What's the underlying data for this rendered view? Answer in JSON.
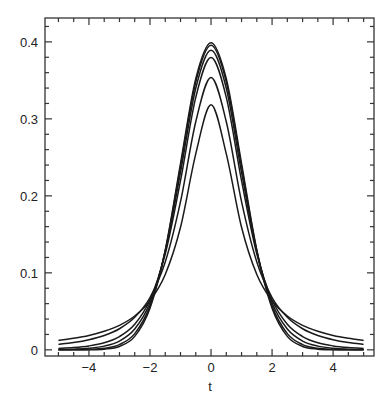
{
  "chart_data": {
    "type": "line",
    "title": "",
    "xlabel": "t",
    "ylabel": "",
    "xlim": [
      -5.44,
      5.34
    ],
    "ylim": [
      -0.008,
      0.431
    ],
    "grid": false,
    "legend": null,
    "x_ticks": [
      -4,
      -2,
      0,
      2,
      4
    ],
    "x_tick_labels": [
      "−4",
      "−2",
      "0",
      "2",
      "4"
    ],
    "x_minor_step": 0.5,
    "y_ticks": [
      0,
      0.1,
      0.2,
      0.3,
      0.4
    ],
    "y_tick_labels": [
      "0",
      "0.1",
      "0.2",
      "0.3",
      "0.4"
    ],
    "y_minor_step": 0.02,
    "x": [
      -5,
      -4.5,
      -4,
      -3.5,
      -3,
      -2.5,
      -2,
      -1.5,
      -1,
      -0.5,
      0,
      0.5,
      1,
      1.5,
      2,
      2.5,
      3,
      3.5,
      4,
      4.5,
      5
    ],
    "series": [
      {
        "name": "Student t, df=1",
        "values": [
          0.0122,
          0.015,
          0.0187,
          0.0241,
          0.0318,
          0.0439,
          0.0637,
          0.0979,
          0.1592,
          0.2546,
          0.3183,
          0.2546,
          0.1592,
          0.0979,
          0.0637,
          0.0439,
          0.0318,
          0.0241,
          0.0187,
          0.015,
          0.0122
        ]
      },
      {
        "name": "Student t, df=2",
        "values": [
          0.0071,
          0.0095,
          0.0131,
          0.0186,
          0.0274,
          0.0422,
          0.068,
          0.1141,
          0.1925,
          0.2963,
          0.3536,
          0.2963,
          0.1925,
          0.1141,
          0.068,
          0.0422,
          0.0274,
          0.0186,
          0.0131,
          0.0095,
          0.0071
        ]
      },
      {
        "name": "Student t, df=5",
        "values": [
          0.0018,
          0.0029,
          0.0051,
          0.0092,
          0.0173,
          0.0333,
          0.0651,
          0.1245,
          0.2197,
          0.3279,
          0.3796,
          0.3279,
          0.2197,
          0.1245,
          0.0651,
          0.0333,
          0.0173,
          0.0092,
          0.0051,
          0.0029,
          0.0018
        ]
      },
      {
        "name": "Student t, df=10",
        "values": [
          0.0004,
          0.0009,
          0.002,
          0.0048,
          0.0114,
          0.027,
          0.0611,
          0.1275,
          0.2304,
          0.3397,
          0.3891,
          0.3397,
          0.2304,
          0.1275,
          0.0611,
          0.027,
          0.0114,
          0.0048,
          0.002,
          0.0009,
          0.0004
        ]
      },
      {
        "name": "Student t, df=30",
        "values": [
          0.0,
          0.0001,
          0.0005,
          0.002,
          0.0068,
          0.0211,
          0.0571,
          0.1289,
          0.238,
          0.3479,
          0.3956,
          0.3479,
          0.238,
          0.1289,
          0.0571,
          0.0211,
          0.0068,
          0.002,
          0.0005,
          0.0001,
          0.0
        ]
      },
      {
        "name": "Normal (df=∞)",
        "values": [
          0.0,
          0.0,
          0.0001,
          0.0009,
          0.0044,
          0.0175,
          0.054,
          0.1295,
          0.242,
          0.3521,
          0.3989,
          0.3521,
          0.242,
          0.1295,
          0.054,
          0.0175,
          0.0044,
          0.0009,
          0.0001,
          0.0,
          0.0
        ]
      }
    ]
  }
}
